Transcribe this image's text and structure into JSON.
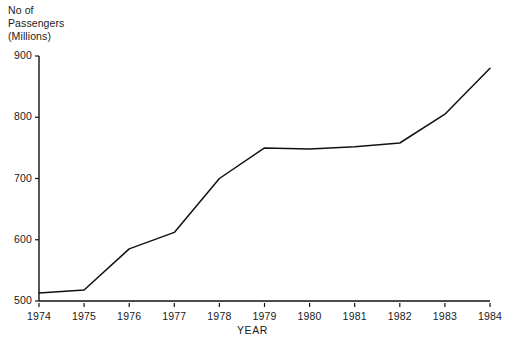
{
  "chart_data": {
    "type": "line",
    "title": "",
    "ylabel": "No of\nPassengers\n(Millions)",
    "xlabel": "YEAR",
    "categories": [
      "1974",
      "1975",
      "1976",
      "1977",
      "1978",
      "1979",
      "1980",
      "1981",
      "1982",
      "1983",
      "1984"
    ],
    "x": [
      1974,
      1975,
      1976,
      1977,
      1978,
      1979,
      1980,
      1981,
      1982,
      1983,
      1984
    ],
    "values": [
      513,
      518,
      585,
      612,
      700,
      750,
      748,
      752,
      758,
      805,
      880
    ],
    "ylim": [
      500,
      900
    ],
    "xlim": [
      1974,
      1984
    ],
    "yticks": [
      500,
      600,
      700,
      800,
      900
    ],
    "ytick_labels": [
      "500",
      "600",
      "700",
      "800",
      "900"
    ],
    "xticks": [
      1974,
      1975,
      1976,
      1977,
      1978,
      1979,
      1980,
      1981,
      1982,
      1983,
      1984
    ],
    "xtick_labels": [
      "1974",
      "1975",
      "1976",
      "1977",
      "1978",
      "1979",
      "1980",
      "1981",
      "1982",
      "1983",
      "1984"
    ],
    "grid": false,
    "legend": null,
    "legend_position": "none",
    "series": [
      {
        "name": "Passengers",
        "color": "#111111",
        "values": [
          513,
          518,
          585,
          612,
          700,
          750,
          748,
          752,
          758,
          805,
          880
        ]
      }
    ],
    "annotations": []
  },
  "colors": {
    "line": "#111111",
    "axis": "#111111",
    "background": "#ffffff",
    "text": "#1a1a1a"
  },
  "axis": {
    "y_title": "No of\nPassengers\n(Millions)",
    "x_title": "YEAR"
  }
}
